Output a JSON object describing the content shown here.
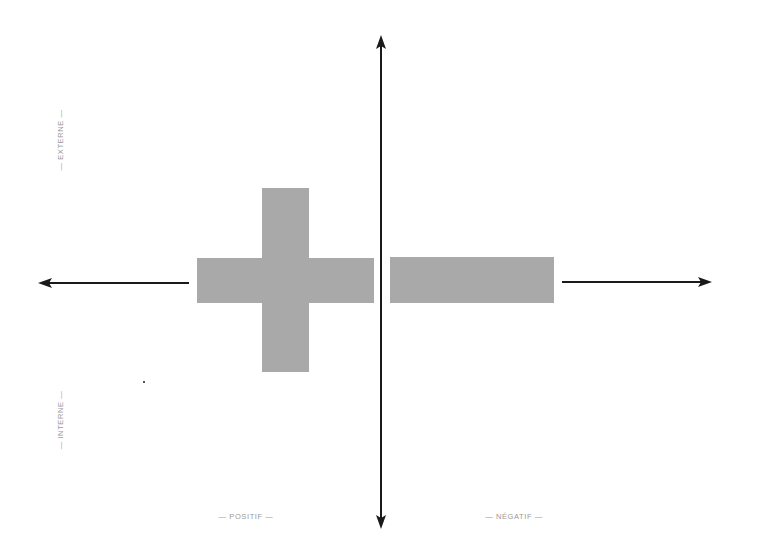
{
  "diagram": {
    "type": "quadrant-axes",
    "axes": {
      "horizontal": {
        "left_arrow": true,
        "right_arrow": true
      },
      "vertical": {
        "up_arrow": true,
        "down_arrow": true
      }
    },
    "labels": {
      "top_left_vertical": "— EXTERNE —",
      "bottom_left_vertical": "— INTERNE —",
      "bottom_left_horizontal": "— POSITIF —",
      "bottom_right_horizontal": "— NÉGATIF —"
    },
    "symbols": {
      "left": "plus-sign",
      "right": "minus-sign"
    },
    "colors": {
      "axis": "#1a1a1a",
      "shape_fill": "#a9a9a9",
      "label_text": "#9a9a9a",
      "background": "#ffffff"
    }
  }
}
